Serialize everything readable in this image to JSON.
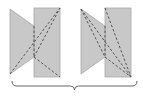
{
  "diagram": {
    "colors": {
      "fill": "#c8c8c8",
      "stroke": "#a8a8a8",
      "dash": "#555555",
      "brace": "#666666"
    },
    "figures": [
      {
        "id": "left",
        "quad": [
          [
            10,
            9
          ],
          [
            34,
            26
          ],
          [
            34,
            57
          ],
          [
            10,
            74
          ]
        ],
        "rect": {
          "x": 34,
          "y": 8,
          "w": 26,
          "h": 69
        },
        "dashes": [
          [
            [
              10,
              74
            ],
            [
              60,
              8
            ]
          ],
          [
            [
              34,
              57
            ],
            [
              60,
              8
            ]
          ],
          [
            [
              34,
              26
            ],
            [
              34,
              57
            ]
          ],
          [
            [
              34,
              57
            ],
            [
              60,
              77
            ]
          ]
        ]
      },
      {
        "id": "right",
        "quad": [
          [
            81,
            9
          ],
          [
            105,
            26
          ],
          [
            105,
            57
          ],
          [
            81,
            74
          ]
        ],
        "rect": {
          "x": 105,
          "y": 8,
          "w": 26,
          "h": 69
        },
        "dashes": [
          [
            [
              81,
              9
            ],
            [
              131,
              77
            ]
          ],
          [
            [
              81,
              9
            ],
            [
              105,
              57
            ]
          ],
          [
            [
              105,
              8
            ],
            [
              131,
              77
            ]
          ],
          [
            [
              105,
              26
            ],
            [
              105,
              57
            ]
          ],
          [
            [
              105,
              57
            ],
            [
              131,
              77
            ]
          ]
        ]
      }
    ],
    "brace": {
      "x1": 12,
      "x2": 137,
      "y": 86
    }
  }
}
